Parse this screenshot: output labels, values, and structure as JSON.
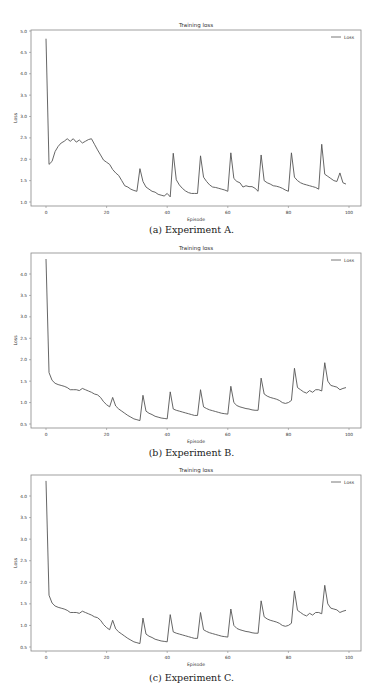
{
  "chart_data": [
    {
      "id": "a",
      "type": "line",
      "title": "Training loss",
      "xlabel": "Episode",
      "ylabel": "Loss",
      "legend": [
        "Loss"
      ],
      "legend_position": "upper right",
      "caption": "(a) Experiment A.",
      "xlim": [
        -5,
        103
      ],
      "ylim": [
        0.95,
        5.0
      ],
      "xticks": [
        0,
        20,
        40,
        60,
        80,
        100
      ],
      "yticks": [
        1.0,
        1.5,
        2.0,
        2.5,
        3.0,
        3.5,
        4.0,
        4.5,
        5.0
      ],
      "ytick_labels": [
        "1.0",
        "1.5",
        "2.0",
        "2.5",
        "3.0",
        "3.5",
        "4.0",
        "4.5",
        "5.0"
      ],
      "grid": false,
      "series": [
        {
          "name": "Loss",
          "x": [
            0,
            1,
            2,
            3,
            4,
            5,
            6,
            7,
            8,
            9,
            10,
            11,
            12,
            13,
            14,
            15,
            16,
            17,
            18,
            19,
            20,
            21,
            22,
            23,
            24,
            25,
            26,
            27,
            28,
            29,
            30,
            31,
            32,
            33,
            34,
            35,
            36,
            37,
            38,
            39,
            40,
            41,
            42,
            43,
            44,
            45,
            46,
            47,
            48,
            49,
            50,
            51,
            52,
            53,
            54,
            55,
            56,
            57,
            58,
            59,
            60,
            61,
            62,
            63,
            64,
            65,
            66,
            67,
            68,
            69,
            70,
            71,
            72,
            73,
            74,
            75,
            76,
            77,
            78,
            79,
            80,
            81,
            82,
            83,
            84,
            85,
            86,
            87,
            88,
            89,
            90,
            91,
            92,
            93,
            94,
            95,
            96,
            97,
            98,
            99
          ],
          "values": [
            4.82,
            1.88,
            1.95,
            2.18,
            2.3,
            2.38,
            2.42,
            2.48,
            2.42,
            2.48,
            2.4,
            2.45,
            2.38,
            2.42,
            2.46,
            2.48,
            2.35,
            2.22,
            2.1,
            1.98,
            1.93,
            1.88,
            1.76,
            1.68,
            1.62,
            1.5,
            1.38,
            1.35,
            1.3,
            1.27,
            1.25,
            1.78,
            1.48,
            1.35,
            1.3,
            1.25,
            1.23,
            1.18,
            1.16,
            1.14,
            1.2,
            1.12,
            2.14,
            1.52,
            1.4,
            1.32,
            1.26,
            1.22,
            1.2,
            1.2,
            1.2,
            2.08,
            1.58,
            1.48,
            1.4,
            1.35,
            1.34,
            1.32,
            1.3,
            1.28,
            1.25,
            2.15,
            1.55,
            1.48,
            1.45,
            1.35,
            1.38,
            1.36,
            1.36,
            1.32,
            1.25,
            2.1,
            1.5,
            1.45,
            1.42,
            1.38,
            1.37,
            1.35,
            1.32,
            1.28,
            1.25,
            2.15,
            1.58,
            1.5,
            1.45,
            1.42,
            1.4,
            1.38,
            1.36,
            1.34,
            1.3,
            2.35,
            1.65,
            1.6,
            1.55,
            1.5,
            1.48,
            1.68,
            1.45,
            1.42
          ]
        }
      ]
    },
    {
      "id": "b",
      "type": "line",
      "title": "Training loss",
      "xlabel": "Episode",
      "ylabel": "Loss",
      "legend": [
        "Loss"
      ],
      "legend_position": "upper right",
      "caption": "(b) Experiment B.",
      "xlim": [
        -5,
        103
      ],
      "ylim": [
        0.45,
        4.5
      ],
      "xticks": [
        0,
        20,
        40,
        60,
        80,
        100
      ],
      "yticks": [
        0.5,
        1.0,
        1.5,
        2.0,
        2.5,
        3.0,
        3.5,
        4.0
      ],
      "ytick_labels": [
        "0.5",
        "1.0",
        "1.5",
        "2.0",
        "2.5",
        "3.0",
        "3.5",
        "4.0"
      ],
      "grid": false,
      "series": [
        {
          "name": "Loss",
          "x": [
            0,
            1,
            2,
            3,
            4,
            5,
            6,
            7,
            8,
            9,
            10,
            11,
            12,
            13,
            14,
            15,
            16,
            17,
            18,
            19,
            20,
            21,
            22,
            23,
            24,
            25,
            26,
            27,
            28,
            29,
            30,
            31,
            32,
            33,
            34,
            35,
            36,
            37,
            38,
            39,
            40,
            41,
            42,
            43,
            44,
            45,
            46,
            47,
            48,
            49,
            50,
            51,
            52,
            53,
            54,
            55,
            56,
            57,
            58,
            59,
            60,
            61,
            62,
            63,
            64,
            65,
            66,
            67,
            68,
            69,
            70,
            71,
            72,
            73,
            74,
            75,
            76,
            77,
            78,
            79,
            80,
            81,
            82,
            83,
            84,
            85,
            86,
            87,
            88,
            89,
            90,
            91,
            92,
            93,
            94,
            95,
            96,
            97,
            98,
            99
          ],
          "values": [
            4.35,
            1.7,
            1.52,
            1.45,
            1.42,
            1.4,
            1.38,
            1.35,
            1.3,
            1.3,
            1.3,
            1.28,
            1.33,
            1.3,
            1.27,
            1.24,
            1.2,
            1.18,
            1.12,
            1.02,
            0.95,
            0.9,
            1.12,
            0.92,
            0.85,
            0.8,
            0.75,
            0.7,
            0.66,
            0.62,
            0.6,
            0.58,
            1.17,
            0.8,
            0.75,
            0.72,
            0.68,
            0.66,
            0.64,
            0.63,
            0.62,
            1.25,
            0.85,
            0.82,
            0.8,
            0.78,
            0.76,
            0.74,
            0.72,
            0.7,
            0.7,
            1.3,
            0.9,
            0.86,
            0.83,
            0.81,
            0.79,
            0.77,
            0.75,
            0.74,
            0.73,
            1.38,
            1.0,
            0.93,
            0.9,
            0.88,
            0.86,
            0.85,
            0.83,
            0.82,
            0.82,
            1.57,
            1.2,
            1.15,
            1.12,
            1.1,
            1.08,
            1.05,
            1.0,
            0.98,
            1.0,
            1.05,
            1.8,
            1.35,
            1.3,
            1.25,
            1.22,
            1.28,
            1.24,
            1.3,
            1.3,
            1.27,
            1.93,
            1.5,
            1.4,
            1.38,
            1.36,
            1.3,
            1.33,
            1.35
          ]
        }
      ]
    },
    {
      "id": "c",
      "type": "line",
      "title": "Training loss",
      "xlabel": "Episode",
      "ylabel": "Loss",
      "legend": [
        "Loss"
      ],
      "legend_position": "upper right",
      "caption": "(c) Experiment C.",
      "xlim": [
        -5,
        103
      ],
      "ylim": [
        0.45,
        4.5
      ],
      "xticks": [
        0,
        20,
        40,
        60,
        80,
        100
      ],
      "yticks": [
        0.5,
        1.0,
        1.5,
        2.0,
        2.5,
        3.0,
        3.5,
        4.0
      ],
      "ytick_labels": [
        "0.5",
        "1.0",
        "1.5",
        "2.0",
        "2.5",
        "3.0",
        "3.5",
        "4.0"
      ],
      "grid": false,
      "series": [
        {
          "name": "Loss",
          "x": [
            0,
            1,
            2,
            3,
            4,
            5,
            6,
            7,
            8,
            9,
            10,
            11,
            12,
            13,
            14,
            15,
            16,
            17,
            18,
            19,
            20,
            21,
            22,
            23,
            24,
            25,
            26,
            27,
            28,
            29,
            30,
            31,
            32,
            33,
            34,
            35,
            36,
            37,
            38,
            39,
            40,
            41,
            42,
            43,
            44,
            45,
            46,
            47,
            48,
            49,
            50,
            51,
            52,
            53,
            54,
            55,
            56,
            57,
            58,
            59,
            60,
            61,
            62,
            63,
            64,
            65,
            66,
            67,
            68,
            69,
            70,
            71,
            72,
            73,
            74,
            75,
            76,
            77,
            78,
            79,
            80,
            81,
            82,
            83,
            84,
            85,
            86,
            87,
            88,
            89,
            90,
            91,
            92,
            93,
            94,
            95,
            96,
            97,
            98,
            99
          ],
          "values": [
            4.35,
            1.7,
            1.52,
            1.45,
            1.42,
            1.4,
            1.38,
            1.35,
            1.3,
            1.3,
            1.3,
            1.28,
            1.33,
            1.3,
            1.27,
            1.24,
            1.2,
            1.18,
            1.12,
            1.02,
            0.95,
            0.9,
            1.12,
            0.92,
            0.85,
            0.8,
            0.75,
            0.7,
            0.66,
            0.62,
            0.6,
            0.58,
            1.17,
            0.8,
            0.75,
            0.72,
            0.68,
            0.66,
            0.64,
            0.63,
            0.62,
            1.25,
            0.85,
            0.82,
            0.8,
            0.78,
            0.76,
            0.74,
            0.72,
            0.7,
            0.7,
            1.3,
            0.9,
            0.86,
            0.83,
            0.81,
            0.79,
            0.77,
            0.75,
            0.74,
            0.73,
            1.38,
            1.0,
            0.93,
            0.9,
            0.88,
            0.86,
            0.85,
            0.83,
            0.82,
            0.82,
            1.57,
            1.2,
            1.15,
            1.12,
            1.1,
            1.08,
            1.05,
            1.0,
            0.98,
            1.0,
            1.05,
            1.8,
            1.35,
            1.3,
            1.25,
            1.22,
            1.28,
            1.24,
            1.3,
            1.3,
            1.27,
            1.93,
            1.5,
            1.4,
            1.38,
            1.36,
            1.3,
            1.33,
            1.35
          ]
        }
      ]
    }
  ],
  "layout": {
    "line_color": "#555555",
    "frame_color": "#888888"
  }
}
